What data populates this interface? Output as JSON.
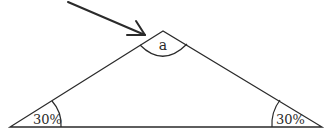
{
  "diagram": {
    "type": "triangle-angles",
    "labels": {
      "apex_angle": "a",
      "left_base_angle": "30%",
      "right_base_angle": "30%"
    },
    "colors": {
      "stroke": "#2a2a2a",
      "background": "#ffffff"
    },
    "arrow": {
      "points_to": "apex"
    }
  }
}
